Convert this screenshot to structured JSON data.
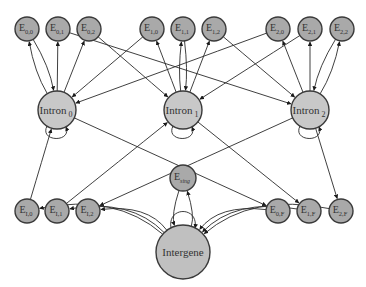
{
  "diagram": {
    "title": "",
    "colors": {
      "exon": "#a9a9a9",
      "intron": "#c8c8c8",
      "intergene": "#c0c0c0",
      "edge": "#2a2a2a",
      "stroke": "#3a3a3a"
    },
    "nodes": [
      {
        "id": "E00",
        "base": "E",
        "sub": "0,0",
        "x": 27,
        "y": 29,
        "r": 12,
        "kind": "exon"
      },
      {
        "id": "E01",
        "base": "E",
        "sub": "0,1",
        "x": 58,
        "y": 29,
        "r": 12,
        "kind": "exon"
      },
      {
        "id": "E02",
        "base": "E",
        "sub": "0,2",
        "x": 89,
        "y": 29,
        "r": 12,
        "kind": "exon"
      },
      {
        "id": "E10",
        "base": "E",
        "sub": "1,0",
        "x": 152,
        "y": 29,
        "r": 12,
        "kind": "exon"
      },
      {
        "id": "E11",
        "base": "E",
        "sub": "1,1",
        "x": 183,
        "y": 29,
        "r": 12,
        "kind": "exon"
      },
      {
        "id": "E12",
        "base": "E",
        "sub": "1,2",
        "x": 214,
        "y": 29,
        "r": 12,
        "kind": "exon"
      },
      {
        "id": "E20",
        "base": "E",
        "sub": "2,0",
        "x": 278,
        "y": 29,
        "r": 12,
        "kind": "exon"
      },
      {
        "id": "E21",
        "base": "E",
        "sub": "2,1",
        "x": 310,
        "y": 29,
        "r": 12,
        "kind": "exon"
      },
      {
        "id": "E22",
        "base": "E",
        "sub": "2,2",
        "x": 342,
        "y": 29,
        "r": 12,
        "kind": "exon"
      },
      {
        "id": "I0",
        "base": "Intron",
        "sub": "0",
        "x": 57,
        "y": 110,
        "r": 19,
        "kind": "intron"
      },
      {
        "id": "I1",
        "base": "Intron",
        "sub": "1",
        "x": 183,
        "y": 110,
        "r": 19,
        "kind": "intron"
      },
      {
        "id": "I2",
        "base": "Intron",
        "sub": "2",
        "x": 310,
        "y": 110,
        "r": 19,
        "kind": "intron"
      },
      {
        "id": "EI0",
        "base": "E",
        "sub": "I,0",
        "x": 27,
        "y": 211,
        "r": 12,
        "kind": "exon"
      },
      {
        "id": "EI1",
        "base": "E",
        "sub": "I,1",
        "x": 57,
        "y": 211,
        "r": 12,
        "kind": "exon"
      },
      {
        "id": "EI2",
        "base": "E",
        "sub": "I,2",
        "x": 88,
        "y": 211,
        "r": 12,
        "kind": "exon"
      },
      {
        "id": "Esing",
        "base": "E",
        "sub": "sing",
        "x": 183,
        "y": 178,
        "r": 13,
        "kind": "exon"
      },
      {
        "id": "E0F",
        "base": "E",
        "sub": "0,F",
        "x": 278,
        "y": 211,
        "r": 12,
        "kind": "exon"
      },
      {
        "id": "E1F",
        "base": "E",
        "sub": "1,F",
        "x": 309,
        "y": 211,
        "r": 12,
        "kind": "exon"
      },
      {
        "id": "E2F",
        "base": "E",
        "sub": "2,F",
        "x": 341,
        "y": 211,
        "r": 12,
        "kind": "exon"
      },
      {
        "id": "IG",
        "base": "Intergene",
        "sub": "",
        "x": 183,
        "y": 252,
        "r": 27,
        "kind": "intergene"
      }
    ],
    "edges": [
      {
        "from": "I0",
        "to": "E00",
        "bend": -8
      },
      {
        "from": "E00",
        "to": "I0",
        "bend": -8
      },
      {
        "from": "I0",
        "to": "E01",
        "bend": 0
      },
      {
        "from": "I0",
        "to": "E02",
        "bend": 0
      },
      {
        "from": "E02",
        "to": "I1",
        "bend": 0
      },
      {
        "from": "I1",
        "to": "E10",
        "bend": 0
      },
      {
        "from": "E10",
        "to": "I0",
        "bend": 0
      },
      {
        "from": "I1",
        "to": "E11",
        "bend": -5
      },
      {
        "from": "E11",
        "to": "I1",
        "bend": -5
      },
      {
        "from": "I1",
        "to": "E12",
        "bend": 0
      },
      {
        "from": "E12",
        "to": "I2",
        "bend": 0
      },
      {
        "from": "E01",
        "to": "I2",
        "bend": 0
      },
      {
        "from": "I2",
        "to": "E20",
        "bend": 0
      },
      {
        "from": "E20",
        "to": "I0",
        "bend": 0
      },
      {
        "from": "I2",
        "to": "E21",
        "bend": 0
      },
      {
        "from": "E21",
        "to": "I1",
        "bend": 0
      },
      {
        "from": "I2",
        "to": "E22",
        "bend": 8
      },
      {
        "from": "E22",
        "to": "I2",
        "bend": 8
      },
      {
        "from": "I0",
        "to": "I0",
        "self": true
      },
      {
        "from": "I1",
        "to": "I1",
        "self": true
      },
      {
        "from": "I2",
        "to": "I2",
        "self": true
      },
      {
        "from": "EI0",
        "to": "I0",
        "bend": 0
      },
      {
        "from": "EI1",
        "to": "I1",
        "bend": 0
      },
      {
        "from": "I2",
        "to": "EI2",
        "bend": 0
      },
      {
        "from": "I0",
        "to": "E0F",
        "bend": 0
      },
      {
        "from": "I1",
        "to": "E1F",
        "bend": 0
      },
      {
        "from": "I2",
        "to": "E2F",
        "bend": 0
      },
      {
        "from": "IG",
        "to": "EI0",
        "bend": 40
      },
      {
        "from": "IG",
        "to": "EI1",
        "bend": 35
      },
      {
        "from": "IG",
        "to": "EI2",
        "bend": 30
      },
      {
        "from": "E0F",
        "to": "IG",
        "bend": 30
      },
      {
        "from": "E1F",
        "to": "IG",
        "bend": 35
      },
      {
        "from": "E2F",
        "to": "IG",
        "bend": 40
      },
      {
        "from": "IG",
        "to": "Esing",
        "bend": 12
      },
      {
        "from": "Esing",
        "to": "IG",
        "bend": 12
      },
      {
        "from": "IG",
        "to": "IG",
        "self": true,
        "top": true
      }
    ]
  }
}
